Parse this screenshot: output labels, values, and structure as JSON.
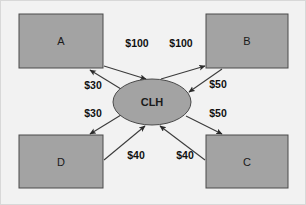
{
  "diagram": {
    "background_color": "#f2f2f2",
    "node_fill_color": "#a3a3a3",
    "node_stroke_color": "#4a4a4a",
    "edge_color": "#3b3b3b",
    "hub": {
      "label": "CLH",
      "shape": "ellipse",
      "cx": 152,
      "cy": 102,
      "rx": 39,
      "ry": 23
    },
    "nodes": [
      {
        "id": "A",
        "label": "A",
        "shape": "rectangle",
        "x": 19,
        "y": 14,
        "w": 84,
        "h": 54
      },
      {
        "id": "B",
        "label": "B",
        "shape": "rectangle",
        "x": 206,
        "y": 14,
        "w": 82,
        "h": 54
      },
      {
        "id": "C",
        "label": "C",
        "shape": "rectangle",
        "x": 206,
        "y": 135,
        "w": 82,
        "h": 53
      },
      {
        "id": "D",
        "label": "D",
        "shape": "rectangle",
        "x": 19,
        "y": 135,
        "w": 84,
        "h": 53
      }
    ],
    "edges": [
      {
        "id": "a-to-hub",
        "from": "A",
        "to": "CLH",
        "label": "$100",
        "label_x": 137,
        "label_y": 44,
        "x1": 104,
        "y1": 66,
        "x2": 146,
        "y2": 79
      },
      {
        "id": "hub-to-b",
        "from": "CLH",
        "to": "B",
        "label": "$100",
        "label_x": 181,
        "label_y": 44,
        "x1": 161,
        "y1": 79,
        "x2": 205,
        "y2": 66
      },
      {
        "id": "hub-to-a",
        "from": "CLH",
        "to": "A",
        "label": "$30",
        "label_x": 93,
        "label_y": 86,
        "x1": 121,
        "y1": 89,
        "x2": 90,
        "y2": 70
      },
      {
        "id": "hub-to-d",
        "from": "CLH",
        "to": "D",
        "label": "$30",
        "label_x": 93,
        "label_y": 114,
        "x1": 121,
        "y1": 115,
        "x2": 90,
        "y2": 134
      },
      {
        "id": "b-to-hub",
        "from": "B",
        "to": "CLH",
        "label": "$50",
        "label_x": 218,
        "label_y": 85,
        "x1": 222,
        "y1": 69,
        "x2": 189,
        "y2": 92
      },
      {
        "id": "hub-to-c",
        "from": "CLH",
        "to": "C",
        "label": "$50",
        "label_x": 218,
        "label_y": 114,
        "x1": 186,
        "y1": 116,
        "x2": 222,
        "y2": 134
      },
      {
        "id": "d-to-hub",
        "from": "D",
        "to": "CLH",
        "label": "$40",
        "label_x": 136,
        "label_y": 156,
        "x1": 104,
        "y1": 160,
        "x2": 145,
        "y2": 126
      },
      {
        "id": "c-to-hub",
        "from": "C",
        "to": "CLH",
        "label": "$40",
        "label_x": 185,
        "label_y": 156,
        "x1": 205,
        "y1": 160,
        "x2": 160,
        "y2": 126
      }
    ]
  }
}
